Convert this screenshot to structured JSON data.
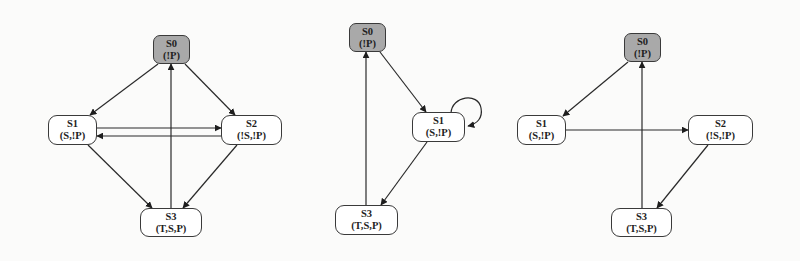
{
  "colors": {
    "initial_fill": "#a9a9a9",
    "state_fill": "#ffffff",
    "stroke": "#2a2a2a",
    "background": "#fbfbfa"
  },
  "diagrams": [
    {
      "id": "left",
      "nodes": [
        {
          "id": "S0",
          "name": "S0",
          "label": "(!P)",
          "initial": true,
          "box": [
            153,
            35,
            37,
            29
          ]
        },
        {
          "id": "S1",
          "name": "S1",
          "label": "(S,!P)",
          "initial": false,
          "box": [
            48,
            115,
            49,
            30
          ]
        },
        {
          "id": "S2",
          "name": "S2",
          "label": "(!S,!P)",
          "initial": false,
          "box": [
            221,
            115,
            61,
            30
          ]
        },
        {
          "id": "S3",
          "name": "S3",
          "label": "(T,S,P)",
          "initial": false,
          "box": [
            140,
            208,
            62,
            29
          ]
        }
      ],
      "edges": [
        {
          "from": "S0",
          "to": "S1"
        },
        {
          "from": "S0",
          "to": "S2"
        },
        {
          "from": "S1",
          "to": "S2"
        },
        {
          "from": "S2",
          "to": "S1"
        },
        {
          "from": "S1",
          "to": "S3"
        },
        {
          "from": "S2",
          "to": "S3"
        },
        {
          "from": "S3",
          "to": "S0"
        }
      ]
    },
    {
      "id": "middle",
      "nodes": [
        {
          "id": "S0",
          "name": "S0",
          "label": "(!P)",
          "initial": true,
          "box": [
            349,
            23,
            37,
            29
          ]
        },
        {
          "id": "S1",
          "name": "S1",
          "label": "(S,!P)",
          "initial": false,
          "box": [
            412,
            112,
            53,
            30
          ]
        },
        {
          "id": "S3",
          "name": "S3",
          "label": "(T,S,P)",
          "initial": false,
          "box": [
            335,
            205,
            63,
            30
          ]
        }
      ],
      "edges": [
        {
          "from": "S0",
          "to": "S1"
        },
        {
          "from": "S1",
          "to": "S1"
        },
        {
          "from": "S1",
          "to": "S3"
        },
        {
          "from": "S3",
          "to": "S0"
        }
      ]
    },
    {
      "id": "right",
      "nodes": [
        {
          "id": "S0",
          "name": "S0",
          "label": "(!P)",
          "initial": true,
          "box": [
            624,
            33,
            37,
            29
          ]
        },
        {
          "id": "S1",
          "name": "S1",
          "label": "(S,!P)",
          "initial": false,
          "box": [
            517,
            115,
            49,
            30
          ]
        },
        {
          "id": "S2",
          "name": "S2",
          "label": "(!S,!P)",
          "initial": false,
          "box": [
            688,
            115,
            65,
            30
          ]
        },
        {
          "id": "S3",
          "name": "S3",
          "label": "(T,S,P)",
          "initial": false,
          "box": [
            611,
            208,
            61,
            29
          ]
        }
      ],
      "edges": [
        {
          "from": "S0",
          "to": "S1"
        },
        {
          "from": "S1",
          "to": "S2"
        },
        {
          "from": "S2",
          "to": "S3"
        },
        {
          "from": "S3",
          "to": "S0"
        }
      ]
    }
  ]
}
